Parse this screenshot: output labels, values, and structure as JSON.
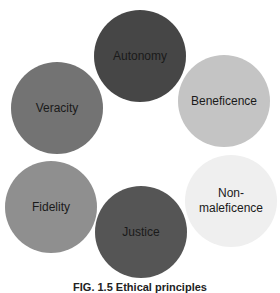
{
  "diagram": {
    "type": "circle-cluster",
    "principles": [
      {
        "label": "Autonomy",
        "color": "#464646",
        "cx": 140,
        "cy": 56,
        "r": 46
      },
      {
        "label": "Beneficence",
        "color": "#c4c4c4",
        "cx": 224,
        "cy": 101,
        "r": 46
      },
      {
        "label": "Non-\nmaleficence",
        "color": "#efefef",
        "cx": 231,
        "cy": 201,
        "r": 46
      },
      {
        "label": "Justice",
        "color": "#555555",
        "cx": 141,
        "cy": 232,
        "r": 46
      },
      {
        "label": "Fidelity",
        "color": "#8f8f8f",
        "cx": 51,
        "cy": 207,
        "r": 46
      },
      {
        "label": "Veracity",
        "color": "#737373",
        "cx": 57,
        "cy": 108,
        "r": 46
      }
    ],
    "caption": "FIG. 1.5  Ethical principles"
  }
}
